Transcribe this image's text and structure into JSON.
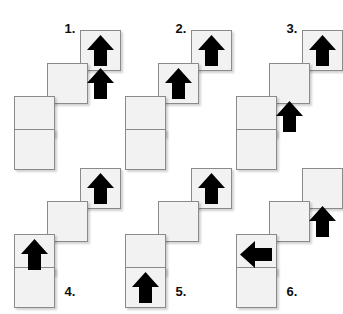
{
  "sheet": {
    "background_color": "#ffffff",
    "tile_fill": "#f2f2f2",
    "tile_border": "#8a8a8a",
    "arrow_color": "#000000",
    "label_color": "#0d0d0d"
  },
  "figures": [
    {
      "id": "figure-1",
      "label": "1.",
      "label_position": "top",
      "tiles": [
        {
          "name": "tile-step1-top",
          "col": 2,
          "row": 0
        },
        {
          "name": "tile-step2-middle",
          "col": 1,
          "row": 1
        },
        {
          "name": "tile-step3-lower",
          "col": 0,
          "row": 2
        },
        {
          "name": "tile-step4-bottom",
          "col": 0,
          "row": 3
        }
      ],
      "arrows": [
        {
          "name": "arrow-up-top",
          "col": 2,
          "row": 0,
          "direction": "up"
        },
        {
          "name": "arrow-up-second",
          "col": 2,
          "row": 1,
          "direction": "up"
        }
      ]
    },
    {
      "id": "figure-2",
      "label": "2.",
      "label_position": "top",
      "tiles": [
        {
          "name": "tile-step1-top",
          "col": 2,
          "row": 0
        },
        {
          "name": "tile-step2-middle",
          "col": 1,
          "row": 1
        },
        {
          "name": "tile-step3-lower",
          "col": 0,
          "row": 2
        },
        {
          "name": "tile-step4-bottom",
          "col": 0,
          "row": 3
        }
      ],
      "arrows": [
        {
          "name": "arrow-up-top",
          "col": 2,
          "row": 0,
          "direction": "up"
        },
        {
          "name": "arrow-up-middle",
          "col": 1,
          "row": 1,
          "direction": "up"
        }
      ]
    },
    {
      "id": "figure-3",
      "label": "3.",
      "label_position": "top",
      "tiles": [
        {
          "name": "tile-step1-top",
          "col": 2,
          "row": 0
        },
        {
          "name": "tile-step2-middle",
          "col": 1,
          "row": 1
        },
        {
          "name": "tile-step3-lower",
          "col": 0,
          "row": 2
        },
        {
          "name": "tile-step4-bottom",
          "col": 0,
          "row": 3
        }
      ],
      "arrows": [
        {
          "name": "arrow-up-top",
          "col": 2,
          "row": 0,
          "direction": "up"
        },
        {
          "name": "arrow-up-lower",
          "col": 1,
          "row": 2,
          "direction": "up"
        }
      ]
    },
    {
      "id": "figure-4",
      "label": "4.",
      "label_position": "bottom",
      "tiles": [
        {
          "name": "tile-step1-top",
          "col": 2,
          "row": 0
        },
        {
          "name": "tile-step2-middle",
          "col": 1,
          "row": 1
        },
        {
          "name": "tile-step3-lower",
          "col": 0,
          "row": 2
        },
        {
          "name": "tile-step4-bottom",
          "col": 0,
          "row": 3
        }
      ],
      "arrows": [
        {
          "name": "arrow-up-top",
          "col": 2,
          "row": 0,
          "direction": "up"
        },
        {
          "name": "arrow-up-lower-left",
          "col": 0,
          "row": 2,
          "direction": "up"
        }
      ]
    },
    {
      "id": "figure-5",
      "label": "5.",
      "label_position": "bottom",
      "tiles": [
        {
          "name": "tile-step1-top",
          "col": 2,
          "row": 0
        },
        {
          "name": "tile-step2-middle",
          "col": 1,
          "row": 1
        },
        {
          "name": "tile-step3-lower",
          "col": 0,
          "row": 2
        },
        {
          "name": "tile-step4-bottom",
          "col": 0,
          "row": 3
        }
      ],
      "arrows": [
        {
          "name": "arrow-up-top",
          "col": 2,
          "row": 0,
          "direction": "up"
        },
        {
          "name": "arrow-up-bottom-left",
          "col": 0,
          "row": 3,
          "direction": "up"
        }
      ]
    },
    {
      "id": "figure-6",
      "label": "6.",
      "label_position": "bottom",
      "tiles": [
        {
          "name": "tile-step1-top",
          "col": 2,
          "row": 0
        },
        {
          "name": "tile-step2-middle",
          "col": 1,
          "row": 1
        },
        {
          "name": "tile-step3-lower",
          "col": 0,
          "row": 2
        },
        {
          "name": "tile-step4-bottom",
          "col": 0,
          "row": 3
        }
      ],
      "arrows": [
        {
          "name": "arrow-up-second",
          "col": 2,
          "row": 1,
          "direction": "up"
        },
        {
          "name": "arrow-left-lower",
          "col": 0,
          "row": 2,
          "direction": "left"
        }
      ]
    }
  ],
  "layout": {
    "columns": 3,
    "rows": 2,
    "cell_width": 111,
    "cell_height": 157,
    "tile_size": 41,
    "step_x": 33,
    "step_y": 33
  }
}
